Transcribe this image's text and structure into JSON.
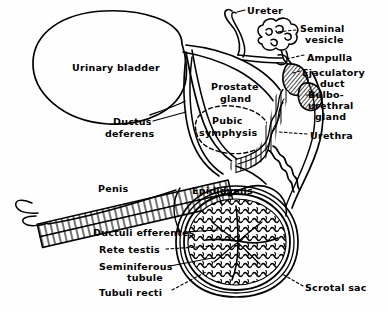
{
  "figure": {
    "background_color": "#fefefe",
    "ink_color": "#000000",
    "width": 388,
    "height": 312
  },
  "labels": [
    {
      "id": "ureter",
      "text": "Ureter",
      "x": 247,
      "y": 6,
      "align": "left"
    },
    {
      "id": "seminal-vesicle",
      "text": "Seminal",
      "x": 300,
      "y": 24,
      "align": "left"
    },
    {
      "id": "seminal-vesicle-2",
      "text": "vesicle",
      "x": 305,
      "y": 35,
      "align": "left"
    },
    {
      "id": "ampulla",
      "text": "Ampulla",
      "x": 307,
      "y": 53,
      "align": "left"
    },
    {
      "id": "ejaculatory-duct",
      "text": "Ejaculatory",
      "x": 302,
      "y": 68,
      "align": "left"
    },
    {
      "id": "ejaculatory-duct-2",
      "text": "duct",
      "x": 320,
      "y": 79,
      "align": "left"
    },
    {
      "id": "bulbourethral",
      "text": "Bulbo-",
      "x": 308,
      "y": 90,
      "align": "left"
    },
    {
      "id": "bulbourethral-2",
      "text": "urethral",
      "x": 308,
      "y": 101,
      "align": "left"
    },
    {
      "id": "bulbourethral-3",
      "text": "gland",
      "x": 315,
      "y": 112,
      "align": "left"
    },
    {
      "id": "urethra",
      "text": "Urethra",
      "x": 310,
      "y": 131,
      "align": "left"
    },
    {
      "id": "urinary-bladder",
      "text": "Urinary bladder",
      "x": 72,
      "y": 63,
      "align": "left"
    },
    {
      "id": "prostate-gland",
      "text": "Prostate",
      "x": 211,
      "y": 82,
      "align": "left"
    },
    {
      "id": "prostate-gland-2",
      "text": "gland",
      "x": 220,
      "y": 94,
      "align": "left"
    },
    {
      "id": "pubic-symphysis",
      "text": "Pubic",
      "x": 212,
      "y": 116,
      "align": "left"
    },
    {
      "id": "pubic-symphysis-2",
      "text": "symphysis",
      "x": 199,
      "y": 128,
      "align": "left"
    },
    {
      "id": "ductus-deferens",
      "text": "Ductus",
      "x": 113,
      "y": 117,
      "align": "left"
    },
    {
      "id": "ductus-deferens-2",
      "text": "deferens",
      "x": 105,
      "y": 129,
      "align": "left"
    },
    {
      "id": "penis",
      "text": "Penis",
      "x": 98,
      "y": 184,
      "align": "left"
    },
    {
      "id": "epididymis",
      "text": "Epididymis",
      "x": 192,
      "y": 186,
      "align": "left"
    },
    {
      "id": "ductuli-efferentes",
      "text": "Ductuli efferentes",
      "x": 93,
      "y": 228,
      "align": "left"
    },
    {
      "id": "rete-testis",
      "text": "Rete testis",
      "x": 99,
      "y": 245,
      "align": "left"
    },
    {
      "id": "seminiferous-tubule",
      "text": "Seminiferous",
      "x": 99,
      "y": 262,
      "align": "left"
    },
    {
      "id": "seminiferous-tubule-2",
      "text": "tubule",
      "x": 127,
      "y": 273,
      "align": "left"
    },
    {
      "id": "tubuli-recti",
      "text": "Tubuli recti",
      "x": 99,
      "y": 288,
      "align": "left"
    },
    {
      "id": "scrotal-sac",
      "text": "Scrotal sac",
      "x": 305,
      "y": 283,
      "align": "left"
    }
  ],
  "structures": [
    {
      "id": "urinary-bladder",
      "name": "Urinary bladder",
      "kind": "organ-outline"
    },
    {
      "id": "ureter",
      "name": "Ureter",
      "kind": "tube"
    },
    {
      "id": "seminal-vesicle",
      "name": "Seminal vesicle",
      "kind": "lobulated-gland"
    },
    {
      "id": "ampulla",
      "name": "Ampulla",
      "kind": "dilated-duct"
    },
    {
      "id": "ejaculatory-duct",
      "name": "Ejaculatory duct",
      "kind": "hatched-mass"
    },
    {
      "id": "bulbourethral-gland",
      "name": "Bulbo-urethral gland",
      "kind": "hatched-mass"
    },
    {
      "id": "prostate-gland",
      "name": "Prostate gland",
      "kind": "organ-outline"
    },
    {
      "id": "pubic-symphysis",
      "name": "Pubic symphysis",
      "kind": "dashed-ellipse"
    },
    {
      "id": "ductus-deferens",
      "name": "Ductus deferens",
      "kind": "tube"
    },
    {
      "id": "urethra",
      "name": "Urethra",
      "kind": "striated-tube"
    },
    {
      "id": "penis",
      "name": "Penis",
      "kind": "striated-shaft"
    },
    {
      "id": "epididymis",
      "name": "Epididymis",
      "kind": "coiled-duct"
    },
    {
      "id": "testis",
      "name": "Testis",
      "kind": "coiled-tubule-mass"
    },
    {
      "id": "scrotal-sac",
      "name": "Scrotal sac",
      "kind": "organ-outline"
    }
  ]
}
